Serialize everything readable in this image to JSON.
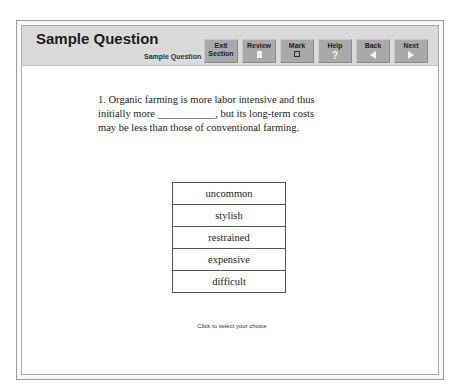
{
  "header": {
    "title": "Sample Question",
    "subtitle": "Sample Question"
  },
  "toolbar": {
    "buttons": [
      {
        "id": "exit",
        "label_line1": "Exit",
        "label_line2": "Section",
        "icon": "none"
      },
      {
        "id": "review",
        "label": "Review",
        "icon": "page-icon"
      },
      {
        "id": "mark",
        "label": "Mark",
        "icon": "checkbox-icon"
      },
      {
        "id": "help",
        "label": "Help",
        "icon": "question-icon",
        "glyph": "?"
      },
      {
        "id": "back",
        "label": "Back",
        "icon": "arrow-left-icon"
      },
      {
        "id": "next",
        "label": "Next",
        "icon": "arrow-right-icon"
      }
    ]
  },
  "question": {
    "line1": "1. Organic farming is more labor intensive and thus",
    "line2": "initially more ___________, but its long-term costs",
    "line3": "may be less than those of conventional farming."
  },
  "choices": [
    "uncommon",
    "stylish",
    "restrained",
    "expensive",
    "difficult"
  ],
  "footer": {
    "hint": "Click to select your choice"
  },
  "colors": {
    "header_bg": "#dadada",
    "button_bg": "#a9a9a9",
    "border": "#9a9a9a"
  }
}
